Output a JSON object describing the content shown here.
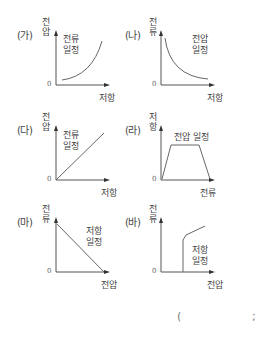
{
  "panels": [
    {
      "id": "ga",
      "label": "(가)",
      "y_axis": [
        "전",
        "압"
      ],
      "x_axis": "저항",
      "origin": "0",
      "note": [
        "전류",
        "일정"
      ],
      "curve": "increasing-convex"
    },
    {
      "id": "na",
      "label": "(나)",
      "y_axis": [
        "전",
        "류"
      ],
      "x_axis": "저항",
      "origin": "0",
      "note": [
        "전압",
        "일정"
      ],
      "curve": "decreasing-hyperbola"
    },
    {
      "id": "da",
      "label": "(다)",
      "y_axis": [
        "전",
        "압"
      ],
      "x_axis": "저항",
      "origin": "0",
      "note": [
        "전류",
        "일정"
      ],
      "curve": "linear-through-origin"
    },
    {
      "id": "ra",
      "label": "(라)",
      "y_axis": [
        "저",
        "항"
      ],
      "x_axis": "전류",
      "origin": "0",
      "note": [
        "전압 일정"
      ],
      "curve": "trapezoid"
    },
    {
      "id": "ma",
      "label": "(마)",
      "y_axis": [
        "전",
        "류"
      ],
      "x_axis": "전압",
      "origin": "0",
      "note": [
        "저항",
        "일정"
      ],
      "curve": "linear-decreasing"
    },
    {
      "id": "ba",
      "label": "(바)",
      "y_axis": [
        "전",
        "류"
      ],
      "x_axis": "전압",
      "origin": "0",
      "note": [
        "저항",
        "일정"
      ],
      "curve": "vertical-then-linear"
    }
  ],
  "answer_blank": {
    "open": "(",
    "close": ";"
  },
  "colors": {
    "axis": "#555555",
    "curve": "#666666",
    "text": "#444444"
  }
}
